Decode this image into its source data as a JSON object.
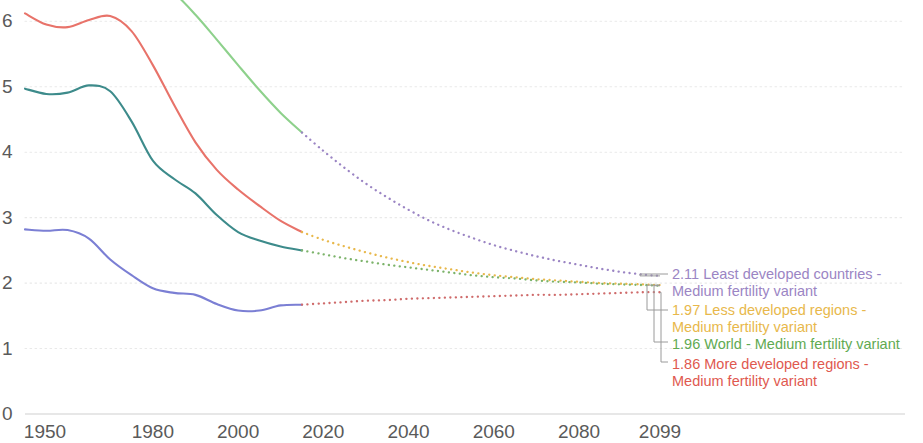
{
  "chart_data": {
    "type": "line",
    "title": "",
    "subtitle": "",
    "xlabel": "",
    "ylabel": "",
    "xlim": [
      1950,
      2099
    ],
    "ylim": [
      0,
      6.6
    ],
    "grid": true,
    "grid_style": "dotted-horizontal",
    "legend_position": "right-inline-end-of-line",
    "x_ticks": [
      "1950",
      "1980",
      "2000",
      "2020",
      "2040",
      "2060",
      "2080",
      "2099"
    ],
    "x_tick_values": [
      1950,
      1980,
      2000,
      2020,
      2040,
      2060,
      2080,
      2099
    ],
    "y_ticks": [
      "0",
      "1",
      "2",
      "3",
      "4",
      "5",
      "6"
    ],
    "y_tick_values": [
      0,
      1,
      2,
      3,
      4,
      5,
      6
    ],
    "historical_end_year": 2015,
    "series": [
      {
        "name": "Least developed countries - Medium fertility variant",
        "end_value": 2.11,
        "solid_color": "#8ed18c",
        "dotted_color": "#9b85c4",
        "label_color": "#9b85c4",
        "x": [
          1950,
          1955,
          1960,
          1965,
          1970,
          1975,
          1980,
          1985,
          1990,
          1995,
          2000,
          2005,
          2010,
          2015,
          2020,
          2025,
          2030,
          2035,
          2040,
          2045,
          2050,
          2055,
          2060,
          2065,
          2070,
          2075,
          2080,
          2085,
          2090,
          2095,
          2099
        ],
        "values": [
          6.52,
          6.62,
          6.7,
          6.74,
          6.75,
          6.73,
          6.64,
          6.43,
          6.1,
          5.72,
          5.33,
          4.95,
          4.6,
          4.3,
          4.02,
          3.76,
          3.52,
          3.31,
          3.12,
          2.95,
          2.81,
          2.69,
          2.58,
          2.49,
          2.41,
          2.34,
          2.28,
          2.22,
          2.17,
          2.13,
          2.11
        ]
      },
      {
        "name": "Less developed regions - Medium fertility variant",
        "end_value": 1.97,
        "solid_color": "#e8736a",
        "dotted_color": "#e8b84b",
        "label_color": "#e8b84b",
        "x": [
          1950,
          1955,
          1960,
          1965,
          1970,
          1975,
          1980,
          1985,
          1990,
          1995,
          2000,
          2005,
          2010,
          2015,
          2020,
          2025,
          2030,
          2035,
          2040,
          2045,
          2050,
          2055,
          2060,
          2065,
          2070,
          2075,
          2080,
          2085,
          2090,
          2095,
          2099
        ],
        "values": [
          6.12,
          5.95,
          5.91,
          6.02,
          6.08,
          5.85,
          5.33,
          4.72,
          4.15,
          3.73,
          3.43,
          3.18,
          2.95,
          2.78,
          2.66,
          2.56,
          2.47,
          2.39,
          2.32,
          2.26,
          2.21,
          2.16,
          2.12,
          2.09,
          2.06,
          2.04,
          2.02,
          2.0,
          1.99,
          1.98,
          1.97
        ]
      },
      {
        "name": "World - Medium fertility variant",
        "end_value": 1.96,
        "solid_color": "#3d8b8b",
        "dotted_color": "#7cb36a",
        "label_color": "#5faa52",
        "x": [
          1950,
          1955,
          1960,
          1965,
          1970,
          1975,
          1980,
          1985,
          1990,
          1995,
          2000,
          2005,
          2010,
          2015,
          2020,
          2025,
          2030,
          2035,
          2040,
          2045,
          2050,
          2055,
          2060,
          2065,
          2070,
          2075,
          2080,
          2085,
          2090,
          2095,
          2099
        ],
        "values": [
          4.97,
          4.89,
          4.91,
          5.02,
          4.93,
          4.47,
          3.87,
          3.59,
          3.37,
          3.04,
          2.78,
          2.65,
          2.56,
          2.5,
          2.44,
          2.38,
          2.33,
          2.28,
          2.24,
          2.2,
          2.16,
          2.12,
          2.09,
          2.07,
          2.04,
          2.02,
          2.01,
          1.99,
          1.98,
          1.97,
          1.96
        ]
      },
      {
        "name": "More developed regions - Medium fertility variant",
        "end_value": 1.86,
        "solid_color": "#7b7fd4",
        "dotted_color": "#cf6b6b",
        "label_color": "#e0594f",
        "x": [
          1950,
          1955,
          1960,
          1965,
          1970,
          1975,
          1980,
          1985,
          1990,
          1995,
          2000,
          2005,
          2010,
          2015,
          2020,
          2025,
          2030,
          2035,
          2040,
          2045,
          2050,
          2055,
          2060,
          2065,
          2070,
          2075,
          2080,
          2085,
          2090,
          2095,
          2099
        ],
        "values": [
          2.82,
          2.8,
          2.81,
          2.68,
          2.36,
          2.12,
          1.92,
          1.85,
          1.82,
          1.68,
          1.58,
          1.58,
          1.66,
          1.67,
          1.69,
          1.71,
          1.73,
          1.74,
          1.76,
          1.77,
          1.78,
          1.79,
          1.8,
          1.81,
          1.82,
          1.82,
          1.83,
          1.84,
          1.85,
          1.86,
          1.86
        ]
      }
    ]
  },
  "legend": {
    "entries": [
      {
        "value": "2.11",
        "line1": "2.11 Least developed countries -",
        "line2": "Medium fertility variant",
        "color": "#9b85c4"
      },
      {
        "value": "1.97",
        "line1": "1.97 Less developed regions -",
        "line2": "Medium fertility variant",
        "color": "#e8b84b"
      },
      {
        "value": "1.96",
        "line1": "1.96 World - Medium fertility variant",
        "line2": "",
        "color": "#5faa52"
      },
      {
        "value": "1.86",
        "line1": "1.86 More developed regions -",
        "line2": "Medium fertility variant",
        "color": "#e0594f"
      }
    ]
  },
  "axes": {
    "tick_color": "#5a5a5a",
    "grid_color": "#e9e9e9",
    "axis_line_color": "#cfcfcf"
  }
}
